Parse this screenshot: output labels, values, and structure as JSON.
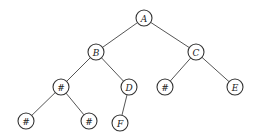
{
  "diagram": {
    "type": "binary-tree",
    "node_radius": 8,
    "nodes": [
      {
        "id": "A",
        "label": "A",
        "x": 144,
        "y": 18
      },
      {
        "id": "B",
        "label": "B",
        "x": 96,
        "y": 52
      },
      {
        "id": "C",
        "label": "C",
        "x": 196,
        "y": 52
      },
      {
        "id": "B1",
        "label": "#",
        "x": 61,
        "y": 87
      },
      {
        "id": "D",
        "label": "D",
        "x": 129,
        "y": 87
      },
      {
        "id": "C1",
        "label": "#",
        "x": 165,
        "y": 87
      },
      {
        "id": "E",
        "label": "E",
        "x": 235,
        "y": 87
      },
      {
        "id": "L1",
        "label": "#",
        "x": 26,
        "y": 121
      },
      {
        "id": "L2",
        "label": "#",
        "x": 89,
        "y": 121
      },
      {
        "id": "F",
        "label": "F",
        "x": 120,
        "y": 123
      }
    ],
    "edges": [
      [
        "A",
        "B"
      ],
      [
        "A",
        "C"
      ],
      [
        "B",
        "B1"
      ],
      [
        "B",
        "D"
      ],
      [
        "C",
        "C1"
      ],
      [
        "C",
        "E"
      ],
      [
        "B1",
        "L1"
      ],
      [
        "B1",
        "L2"
      ],
      [
        "D",
        "F"
      ]
    ]
  }
}
